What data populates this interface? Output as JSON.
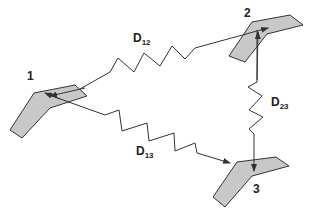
{
  "diagram": {
    "type": "node-distance diagram",
    "colors": {
      "shape_fill": "#c8c8c8",
      "stroke": "#333333",
      "background": "#ffffff"
    },
    "nodes": [
      {
        "id": "1",
        "label": "1"
      },
      {
        "id": "2",
        "label": "2"
      },
      {
        "id": "3",
        "label": "3"
      }
    ],
    "edges": [
      {
        "from": "1",
        "to": "2",
        "label_main": "D",
        "label_sub": "12",
        "style": "spring-arrow"
      },
      {
        "from": "2",
        "to": "3",
        "label_main": "D",
        "label_sub": "23",
        "style": "spring-arrow"
      },
      {
        "from": "1",
        "to": "3",
        "label_main": "D",
        "label_sub": "13",
        "style": "spring-double-arrow"
      }
    ]
  }
}
